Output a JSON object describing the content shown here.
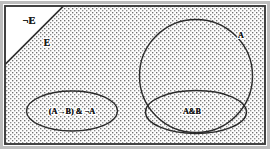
{
  "diagram": {
    "type": "venn-logic-diagram",
    "colors": {
      "background": "#ffffff",
      "frame_border": "#3a3a3a",
      "frame_outer": "#b9b9b9",
      "shading_dot": "#6e6e6e",
      "shading_fill": "#fefefe",
      "curve_stroke": "#2b2b2b",
      "label_text": "#1a1a1a"
    },
    "regions": {
      "outer_frame": {
        "name": "universe-rectangle",
        "x": 5,
        "y": 6,
        "width": 260,
        "height": 138
      },
      "shaded_region": {
        "name": "E-shaded-area",
        "description": "dotted/stippled fill covering the rectangle except the upper-left triangle"
      },
      "white_triangle": {
        "name": "not-E-triangle",
        "description": "unshaded upper-left triangular corner cut by a diagonal line",
        "diagonal_from": [
          5,
          64
        ],
        "diagonal_to": [
          63,
          7
        ]
      },
      "left_ellipse": {
        "name": "implication-and-not-A-ellipse",
        "cx": 72,
        "cy": 111,
        "rx": 46,
        "ry": 20
      },
      "big_circle": {
        "name": "A-circle",
        "cx": 196,
        "cy": 76,
        "r": 57
      },
      "inner_ellipse": {
        "name": "A-and-B-ellipse",
        "cx": 196,
        "cy": 112,
        "rx": 51,
        "ry": 22
      }
    }
  },
  "labels": {
    "not_e": {
      "text": "¬E",
      "x": 29,
      "y": 24,
      "font_size": 10
    },
    "e": {
      "text": "E",
      "x": 47,
      "y": 45,
      "font_size": 9
    },
    "a": {
      "text": "A",
      "x": 241,
      "y": 37,
      "font_size": 8
    },
    "left_ellipse_formula": {
      "text": "(A→B) & ¬A",
      "x": 72,
      "y": 114,
      "font_size": 8
    },
    "a_and_b": {
      "text": "A&B",
      "x": 192,
      "y": 113,
      "font_size": 8
    }
  }
}
